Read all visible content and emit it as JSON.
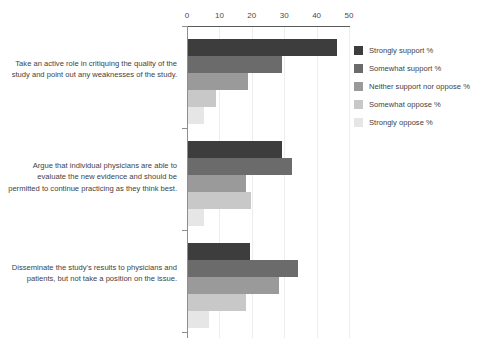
{
  "chart_data": {
    "type": "bar",
    "orientation": "horizontal",
    "grouped": true,
    "title": "",
    "xlabel": "",
    "ylabel": "",
    "xlim": [
      0,
      50
    ],
    "xticks": [
      0,
      10,
      20,
      30,
      40,
      50
    ],
    "xtick_labels": [
      "0",
      "10",
      "20",
      "30",
      "40",
      "50"
    ],
    "grid": true,
    "grid_axis": "x",
    "legend_position": "right",
    "categories": [
      "Take an active role in critiquing the quality of the study and point out any weaknesses of the study.",
      "Argue that individual physicians are able to evaluate the new evidence and should be permitted to continue practicing as they think best.",
      "Disseminate the study's results to physicians and patients, but not take a position on the issue."
    ],
    "series": [
      {
        "name": "Strongly support %",
        "color": "#3d3d3d",
        "values": [
          46,
          29,
          19
        ]
      },
      {
        "name": "Somewhat support %",
        "color": "#6b6b6b",
        "values": [
          29,
          32,
          34
        ]
      },
      {
        "name": "Neither support nor oppose %",
        "color": "#9a9a9a",
        "values": [
          18.5,
          18,
          28
        ]
      },
      {
        "name": "Somewhat oppose %",
        "color": "#c8c8c8",
        "values": [
          8.5,
          19.5,
          18
        ]
      },
      {
        "name": "Strongly oppose %",
        "color": "#e6e6e6",
        "values": [
          5,
          5,
          6.5
        ]
      }
    ]
  },
  "colors": {
    "axis": "#5a5a5a",
    "grid": "#ededed",
    "text": "#3f3f3f",
    "background": "#ffffff"
  }
}
